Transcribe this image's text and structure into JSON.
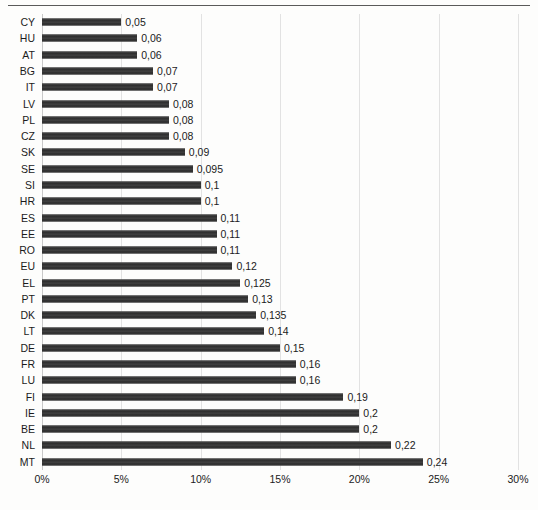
{
  "chart_data": {
    "type": "bar",
    "orientation": "horizontal",
    "title": "",
    "subtitle": "",
    "xlabel": "",
    "ylabel": "",
    "xlim": [
      0,
      0.3
    ],
    "grid": true,
    "legend": false,
    "value_label_format": "comma-decimal",
    "xtick_labels": [
      "0%",
      "5%",
      "10%",
      "15%",
      "20%",
      "25%",
      "30%"
    ],
    "xtick_values": [
      0,
      0.05,
      0.1,
      0.15,
      0.2,
      0.25,
      0.3
    ],
    "categories": [
      "CY",
      "HU",
      "AT",
      "BG",
      "IT",
      "LV",
      "PL",
      "CZ",
      "SK",
      "SE",
      "SI",
      "HR",
      "ES",
      "EE",
      "RO",
      "EU",
      "EL",
      "PT",
      "DK",
      "LT",
      "DE",
      "FR",
      "LU",
      "FI",
      "IE",
      "BE",
      "NL",
      "MT"
    ],
    "values": [
      0.05,
      0.06,
      0.06,
      0.07,
      0.07,
      0.08,
      0.08,
      0.08,
      0.09,
      0.095,
      0.1,
      0.1,
      0.11,
      0.11,
      0.11,
      0.12,
      0.125,
      0.13,
      0.135,
      0.14,
      0.15,
      0.16,
      0.16,
      0.19,
      0.2,
      0.2,
      0.22,
      0.24
    ],
    "value_labels": [
      "0,05",
      "0,06",
      "0,06",
      "0,07",
      "0,07",
      "0,08",
      "0,08",
      "0,08",
      "0,09",
      "0,095",
      "0,1",
      "0,1",
      "0,11",
      "0,11",
      "0,11",
      "0,12",
      "0,125",
      "0,13",
      "0,135",
      "0,14",
      "0,15",
      "0,16",
      "0,16",
      "0,19",
      "0,2",
      "0,2",
      "0,22",
      "0,24"
    ],
    "bar_color": "#3a3a3a",
    "gridline_color": "#e2e2e2",
    "background_color": "#fdfdfc"
  }
}
